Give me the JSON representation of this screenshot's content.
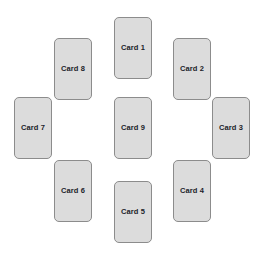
{
  "board": {
    "title": "Card Layout",
    "background_color": "#ffffff",
    "width": 263,
    "height": 261,
    "arrangement": "ring-of-eight-with-center",
    "card_count": 9
  },
  "card_style": {
    "fill_color": "#dcdcdc",
    "border_color": "#8c8c8c",
    "text_color": "#20232a",
    "corner_radius": 5,
    "card_width": 38,
    "card_height": 62
  },
  "cards": [
    {
      "label": "Card 1",
      "x": 114,
      "y": 17,
      "w": 38,
      "h": 62,
      "position": "top"
    },
    {
      "label": "Card 2",
      "x": 173,
      "y": 38,
      "w": 38,
      "h": 62,
      "position": "top-right"
    },
    {
      "label": "Card 3",
      "x": 212,
      "y": 97,
      "w": 38,
      "h": 62,
      "position": "right"
    },
    {
      "label": "Card 4",
      "x": 173,
      "y": 160,
      "w": 38,
      "h": 62,
      "position": "bottom-right"
    },
    {
      "label": "Card 5",
      "x": 114,
      "y": 181,
      "w": 38,
      "h": 62,
      "position": "bottom"
    },
    {
      "label": "Card 6",
      "x": 54,
      "y": 160,
      "w": 38,
      "h": 62,
      "position": "bottom-left"
    },
    {
      "label": "Card 7",
      "x": 14,
      "y": 97,
      "w": 38,
      "h": 62,
      "position": "left"
    },
    {
      "label": "Card 8",
      "x": 54,
      "y": 38,
      "w": 38,
      "h": 62,
      "position": "top-left"
    },
    {
      "label": "Card 9",
      "x": 114,
      "y": 97,
      "w": 38,
      "h": 62,
      "position": "center"
    }
  ]
}
